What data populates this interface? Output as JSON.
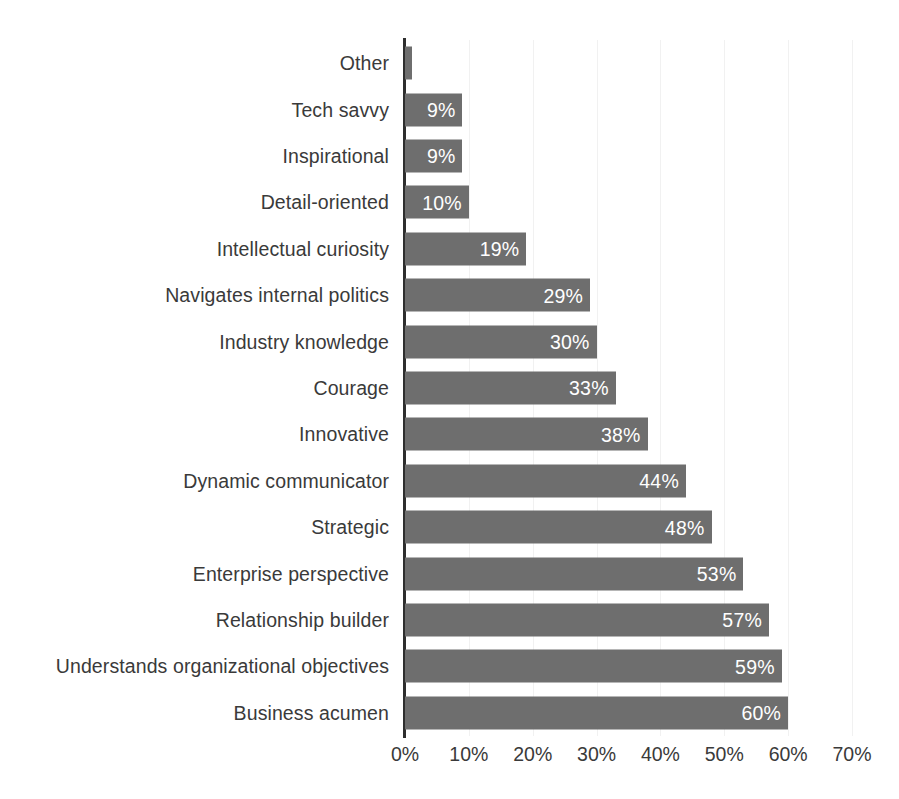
{
  "chart_data": {
    "type": "bar",
    "orientation": "horizontal",
    "title": "",
    "subtitle": "",
    "xlabel": "",
    "ylabel": "",
    "xlim": [
      0,
      70
    ],
    "xticks": [
      0,
      10,
      20,
      30,
      40,
      50,
      60,
      70
    ],
    "xtick_labels": [
      "0%",
      "10%",
      "20%",
      "30%",
      "40%",
      "50%",
      "60%",
      "70%"
    ],
    "grid": true,
    "legend": false,
    "value_suffix": "%",
    "categories": [
      "Other",
      "Tech savvy",
      "Inspirational",
      "Detail-oriented",
      "Intellectual curiosity",
      "Navigates internal politics",
      "Industry knowledge",
      "Courage",
      "Innovative",
      "Dynamic communicator",
      "Strategic",
      "Enterprise perspective",
      "Relationship builder",
      "Understands organizational objectives",
      "Business acumen"
    ],
    "values": [
      1,
      9,
      9,
      10,
      19,
      29,
      30,
      33,
      38,
      44,
      48,
      53,
      57,
      59,
      60
    ],
    "value_labels": [
      "",
      "9%",
      "9%",
      "10%",
      "19%",
      "29%",
      "30%",
      "33%",
      "38%",
      "44%",
      "48%",
      "53%",
      "57%",
      "59%",
      "60%"
    ],
    "bars": [
      {
        "category": "Other",
        "value": 1,
        "label": ""
      },
      {
        "category": "Tech savvy",
        "value": 9,
        "label": "9%"
      },
      {
        "category": "Inspirational",
        "value": 9,
        "label": "9%"
      },
      {
        "category": "Detail-oriented",
        "value": 10,
        "label": "10%"
      },
      {
        "category": "Intellectual curiosity",
        "value": 19,
        "label": "19%"
      },
      {
        "category": "Navigates internal politics",
        "value": 29,
        "label": "29%"
      },
      {
        "category": "Industry knowledge",
        "value": 30,
        "label": "30%"
      },
      {
        "category": "Courage",
        "value": 33,
        "label": "33%"
      },
      {
        "category": "Innovative",
        "value": 38,
        "label": "38%"
      },
      {
        "category": "Dynamic communicator",
        "value": 44,
        "label": "44%"
      },
      {
        "category": "Strategic",
        "value": 48,
        "label": "48%"
      },
      {
        "category": "Enterprise perspective",
        "value": 53,
        "label": "53%"
      },
      {
        "category": "Relationship builder",
        "value": 57,
        "label": "57%"
      },
      {
        "category": "Understands organizational objectives",
        "value": 59,
        "label": "59%"
      },
      {
        "category": "Business acumen",
        "value": 60,
        "label": "60%"
      }
    ]
  },
  "colors": {
    "bar": "#6e6e6e",
    "label_text": "#3a3a3a",
    "value_text": "#ffffff",
    "axis_line": "#2e2e2e",
    "gridline": "#f1f1f1",
    "background": "#ffffff"
  }
}
